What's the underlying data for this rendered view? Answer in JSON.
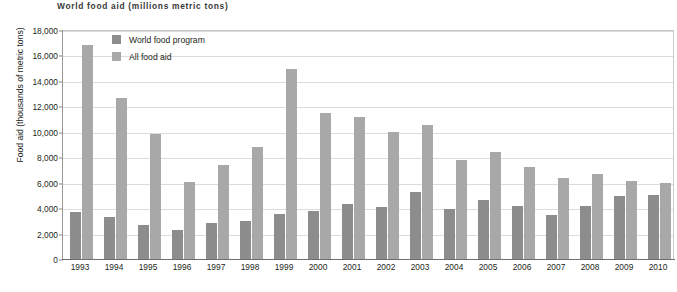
{
  "chart_data": {
    "type": "bar",
    "title": "World food aid (millions metric tons)",
    "xlabel": "",
    "ylabel": "Food aid (thousands of metric tons)",
    "ylim": [
      0,
      18000
    ],
    "ytick_step": 2000,
    "ytick_labels": [
      "0",
      "2,000",
      "4,000",
      "6,000",
      "8,000",
      "10,000",
      "12,000",
      "14,000",
      "16,000",
      "18,000"
    ],
    "ytick_values": [
      0,
      2000,
      4000,
      6000,
      8000,
      10000,
      12000,
      14000,
      16000,
      18000
    ],
    "grid": true,
    "legend_position": "top-left-inside",
    "categories": [
      "1993",
      "1994",
      "1995",
      "1996",
      "1997",
      "1998",
      "1999",
      "2000",
      "2001",
      "2002",
      "2003",
      "2004",
      "2005",
      "2006",
      "2007",
      "2008",
      "2009",
      "2010"
    ],
    "series": [
      {
        "name": "World food program",
        "color": "#8d8d8d",
        "values": [
          3700,
          3300,
          2650,
          2300,
          2800,
          2950,
          3500,
          3800,
          4350,
          4050,
          5250,
          3950,
          4600,
          4150,
          3450,
          4150,
          4950,
          5050
        ]
      },
      {
        "name": "All food aid",
        "color": "#a8a8a8",
        "values": [
          16800,
          12650,
          9800,
          6050,
          7400,
          8800,
          14900,
          11450,
          11200,
          9950,
          10500,
          7750,
          8450,
          7200,
          6350,
          6650,
          6100,
          5950
        ]
      }
    ]
  }
}
